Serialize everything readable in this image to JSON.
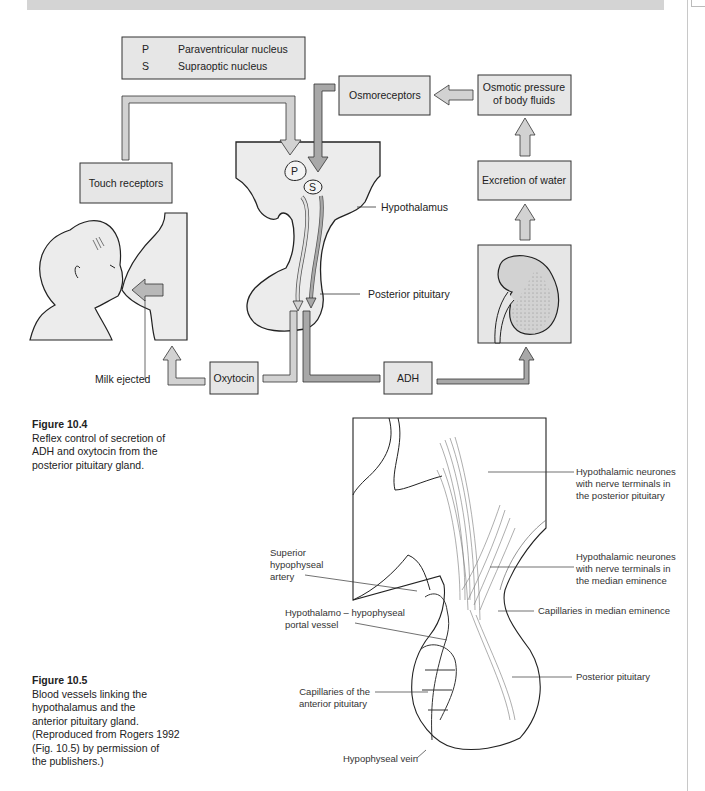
{
  "page": {
    "header_band_text": ""
  },
  "figure_10_4": {
    "legend": {
      "items": [
        {
          "key": "P",
          "label": "Paraventricular nucleus"
        },
        {
          "key": "S",
          "label": "Supraoptic nucleus"
        }
      ]
    },
    "boxes": {
      "osmoreceptors": "Osmoreceptors",
      "osmotic_pressure_line1": "Osmotic pressure",
      "osmotic_pressure_line2": "of body fluids",
      "touch_receptors": "Touch receptors",
      "excretion_of_water": "Excretion of water",
      "oxytocin": "Oxytocin",
      "adh": "ADH"
    },
    "nuclei": {
      "p": "P",
      "s": "S"
    },
    "labels": {
      "hypothalamus": "Hypothalamus",
      "posterior_pituitary": "Posterior pituitary",
      "milk_ejected": "Milk ejected"
    },
    "caption": {
      "title": "Figure 10.4",
      "lines": [
        "Reflex control of secretion of",
        "ADH and oxytocin from the",
        "posterior pituitary gland."
      ]
    }
  },
  "figure_10_5": {
    "labels": {
      "neurones_posterior": [
        "Hypothalamic neurones",
        "with nerve terminals in",
        "the posterior pituitary"
      ],
      "neurones_median": [
        "Hypothalamic neurones",
        "with nerve terminals in",
        "the median eminence"
      ],
      "capillaries_median": "Capillaries in median eminence",
      "posterior_pituitary": "Posterior pituitary",
      "superior_artery": [
        "Superior",
        "hypophyseal",
        "artery"
      ],
      "portal_vessel": [
        "Hypothalamo – hypophyseal",
        "portal vessel"
      ],
      "capillaries_anterior": [
        "Capillaries of the",
        "anterior pituitary"
      ],
      "hypophyseal_vein": "Hypophyseal vein"
    },
    "caption": {
      "title": "Figure 10.5",
      "lines": [
        "Blood vessels linking the",
        "hypothalamus and the",
        "anterior pituitary gland.",
        "(Reproduced from Rogers 1992",
        "(Fig. 10.5) by permission of",
        "the publishers.)"
      ]
    }
  },
  "colors": {
    "box_fill": "#e6e6e6",
    "arrow_light": "#d2d2d2",
    "arrow_dark": "#a8a8a8",
    "tissue_fill": "#ececec",
    "stroke": "#222222"
  }
}
